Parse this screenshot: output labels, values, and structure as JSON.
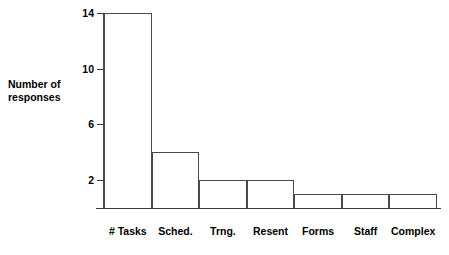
{
  "chart_data": {
    "type": "bar",
    "title": "",
    "xlabel": "",
    "ylabel": "Number of\nresponses",
    "categories": [
      "# Tasks",
      "Sched.",
      "Trng.",
      "Resent",
      "Forms",
      "Staff",
      "Complex"
    ],
    "values": [
      14,
      4,
      2,
      2,
      1,
      1,
      1
    ],
    "ytick_labels": [
      "14",
      "10",
      "6",
      "2"
    ],
    "ytick_values": [
      14,
      10,
      6,
      2
    ],
    "ylim": [
      0,
      14.5
    ],
    "grid": false,
    "legend": null,
    "bar_style": {
      "fill": "#ffffff",
      "outline": "#4a4a4a",
      "gap": 0
    },
    "axis_color": "#3a3a3a",
    "background": "#ffffff"
  }
}
